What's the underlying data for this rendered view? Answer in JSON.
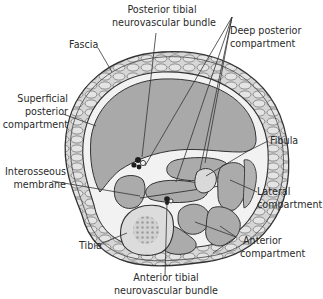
{
  "colors": {
    "background": "#ffffff",
    "muscle_fill": "#a9a9a9",
    "muscle_light": "#bdbdbd",
    "fat_layer": "#d4d4d4",
    "bone": "#d9d9d9",
    "marrow": "#9a9a9a",
    "outline": "#333333",
    "text": "#2a2a2a",
    "neurovascular": "#1e1e1e"
  },
  "labels": {
    "fascia": "Fascia",
    "posterior_tibial_nv": [
      "Posterior tibial",
      "neurovascular bundle"
    ],
    "deep_posterior": [
      "Deep posterior",
      "compartment"
    ],
    "superficial_posterior": [
      "Superficial",
      "posterior",
      "compartment"
    ],
    "fibula": "Fibula",
    "interosseous": [
      "Interosseous",
      "membrane"
    ],
    "lateral": [
      "Lateral",
      "compartment"
    ],
    "tibia": "Tibia",
    "anterior": [
      "Anterior",
      "compartment"
    ],
    "anterior_tibial_nv": [
      "Anterior tibial",
      "neurovascular bundle"
    ]
  }
}
